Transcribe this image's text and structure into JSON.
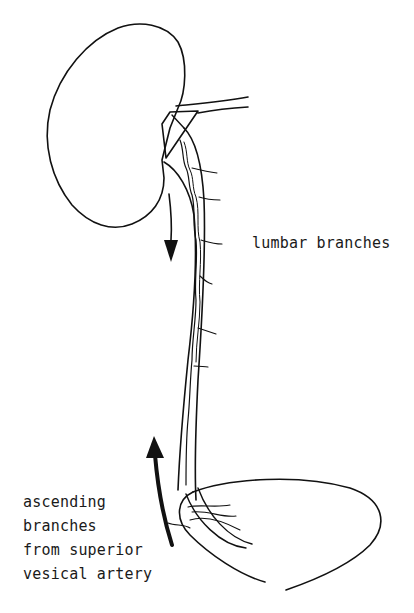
{
  "diagram": {
    "structures": [
      "kidney",
      "renal vessels",
      "ureter",
      "bladder"
    ],
    "labels": {
      "lumbar": "lumbar branches",
      "ascending": {
        "line1": "ascending",
        "line2": "branches",
        "line3": "from superior",
        "line4": "vesical artery"
      }
    },
    "arrows": [
      {
        "name": "descending-flow-arrow",
        "direction": "down"
      },
      {
        "name": "ascending-flow-arrow",
        "direction": "up"
      }
    ],
    "colors": {
      "line": "#111111",
      "background": "#ffffff"
    }
  }
}
